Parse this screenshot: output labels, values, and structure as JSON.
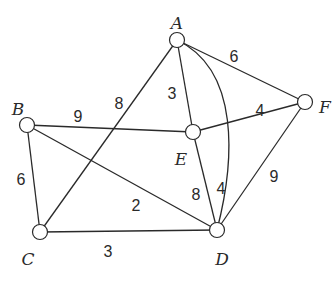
{
  "graph": {
    "nodes": [
      {
        "id": "A",
        "label": "A",
        "x": 177,
        "y": 40,
        "lx": 177,
        "ly": 24
      },
      {
        "id": "B",
        "label": "B",
        "x": 27,
        "y": 125,
        "lx": 18,
        "ly": 110
      },
      {
        "id": "C",
        "label": "C",
        "x": 40,
        "y": 232,
        "lx": 28,
        "ly": 260
      },
      {
        "id": "D",
        "label": "D",
        "x": 217,
        "y": 230,
        "lx": 222,
        "ly": 260
      },
      {
        "id": "E",
        "label": "E",
        "x": 193,
        "y": 132,
        "lx": 181,
        "ly": 160
      },
      {
        "id": "F",
        "label": "F",
        "x": 305,
        "y": 102,
        "lx": 325,
        "ly": 108
      }
    ],
    "edges": [
      {
        "from": "A",
        "to": "C",
        "weight": "8",
        "wx": 119,
        "wy": 105
      },
      {
        "from": "A",
        "to": "E",
        "weight": "3",
        "wx": 172,
        "wy": 95
      },
      {
        "from": "A",
        "to": "F",
        "weight": "6",
        "wx": 234,
        "wy": 58
      },
      {
        "from": "A",
        "to": "D",
        "weight": "4",
        "curve": "M177,40 C240,70 235,160 217,230",
        "wx": 221,
        "wy": 190
      },
      {
        "from": "B",
        "to": "E",
        "weight": "9",
        "wx": 78,
        "wy": 118
      },
      {
        "from": "B",
        "to": "C",
        "weight": "6",
        "wx": 21,
        "wy": 181
      },
      {
        "from": "B",
        "to": "D",
        "weight": "2",
        "wx": 136,
        "wy": 207
      },
      {
        "from": "C",
        "to": "D",
        "weight": "3",
        "wx": 108,
        "wy": 253
      },
      {
        "from": "E",
        "to": "F",
        "weight": "4",
        "wx": 260,
        "wy": 112
      },
      {
        "from": "E",
        "to": "D",
        "weight": "8",
        "wx": 196,
        "wy": 196
      },
      {
        "from": "F",
        "to": "D",
        "weight": "9",
        "wx": 274,
        "wy": 178
      }
    ]
  }
}
